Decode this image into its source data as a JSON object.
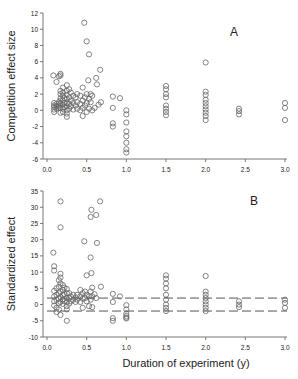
{
  "chart_data": [
    {
      "type": "scatter",
      "panel_label": "A",
      "title": "",
      "xlabel": "",
      "ylabel": "Competition effect size",
      "xlim": [
        0,
        3.0
      ],
      "ylim": [
        -6,
        12
      ],
      "xticks": [
        "0.0",
        "0.5",
        "1.0",
        "1.5",
        "2.0",
        "2.5",
        "3.0"
      ],
      "yticks": [
        "-6",
        "-4",
        "-2",
        "0",
        "2",
        "4",
        "6",
        "8",
        "10",
        "12"
      ],
      "grid": false,
      "legend": null,
      "marker": "open-circle",
      "points": [
        [
          0.08,
          4.3
        ],
        [
          0.12,
          3.5
        ],
        [
          0.15,
          4.2
        ],
        [
          0.17,
          4.5
        ],
        [
          0.17,
          4.3
        ],
        [
          0.09,
          0.9
        ],
        [
          0.09,
          0.6
        ],
        [
          0.09,
          0.4
        ],
        [
          0.09,
          0.1
        ],
        [
          0.09,
          -0.2
        ],
        [
          0.12,
          0.8
        ],
        [
          0.12,
          0.5
        ],
        [
          0.12,
          0.2
        ],
        [
          0.15,
          1.0
        ],
        [
          0.15,
          0.6
        ],
        [
          0.15,
          0.3
        ],
        [
          0.17,
          2.4
        ],
        [
          0.17,
          2.0
        ],
        [
          0.17,
          1.5
        ],
        [
          0.17,
          1.2
        ],
        [
          0.17,
          0.8
        ],
        [
          0.17,
          0.3
        ],
        [
          0.17,
          -0.3
        ],
        [
          0.2,
          2.8
        ],
        [
          0.2,
          2.2
        ],
        [
          0.2,
          1.8
        ],
        [
          0.2,
          1.2
        ],
        [
          0.2,
          0.7
        ],
        [
          0.2,
          0.2
        ],
        [
          0.2,
          -0.2
        ],
        [
          0.22,
          1.5
        ],
        [
          0.22,
          0.9
        ],
        [
          0.22,
          0.4
        ],
        [
          0.25,
          3.1
        ],
        [
          0.25,
          2.4
        ],
        [
          0.25,
          1.9
        ],
        [
          0.25,
          1.4
        ],
        [
          0.25,
          0.9
        ],
        [
          0.25,
          0.5
        ],
        [
          0.25,
          0.0
        ],
        [
          0.25,
          -0.4
        ],
        [
          0.25,
          -0.8
        ],
        [
          0.28,
          2.6
        ],
        [
          0.28,
          1.6
        ],
        [
          0.28,
          0.8
        ],
        [
          0.28,
          0.2
        ],
        [
          0.3,
          2.2
        ],
        [
          0.3,
          1.2
        ],
        [
          0.3,
          0.5
        ],
        [
          0.33,
          1.8
        ],
        [
          0.33,
          0.9
        ],
        [
          0.33,
          0.1
        ],
        [
          0.36,
          1.6
        ],
        [
          0.36,
          0.6
        ],
        [
          0.38,
          2.0
        ],
        [
          0.38,
          1.0
        ],
        [
          0.38,
          0.2
        ],
        [
          0.42,
          1.8
        ],
        [
          0.42,
          0.8
        ],
        [
          0.42,
          0.0
        ],
        [
          0.45,
          2.8
        ],
        [
          0.45,
          1.2
        ],
        [
          0.45,
          0.3
        ],
        [
          0.45,
          -0.7
        ],
        [
          0.48,
          1.6
        ],
        [
          0.48,
          0.6
        ],
        [
          0.5,
          2.0
        ],
        [
          0.5,
          0.9
        ],
        [
          0.5,
          -0.2
        ],
        [
          0.53,
          1.4
        ],
        [
          0.53,
          0.2
        ],
        [
          0.55,
          2.0
        ],
        [
          0.55,
          1.0
        ],
        [
          0.57,
          1.8
        ],
        [
          0.57,
          0.0
        ],
        [
          0.6,
          0.3
        ],
        [
          0.62,
          4.0
        ],
        [
          0.63,
          3.2
        ],
        [
          0.65,
          0.7
        ],
        [
          0.67,
          5.0
        ],
        [
          0.68,
          1.0
        ],
        [
          0.52,
          3.7
        ],
        [
          0.47,
          10.8
        ],
        [
          0.5,
          8.5
        ],
        [
          0.53,
          6.9
        ],
        [
          0.83,
          1.7
        ],
        [
          0.83,
          0.3
        ],
        [
          0.83,
          -1.6
        ],
        [
          0.83,
          -2.0
        ],
        [
          0.92,
          1.5
        ],
        [
          1.0,
          0.0
        ],
        [
          1.0,
          -0.5
        ],
        [
          1.0,
          -1.5
        ],
        [
          1.0,
          -2.6
        ],
        [
          1.0,
          -3.2
        ],
        [
          1.0,
          -4.0
        ],
        [
          1.0,
          -4.8
        ],
        [
          1.0,
          -5.2
        ],
        [
          1.5,
          3.0
        ],
        [
          1.5,
          2.6
        ],
        [
          1.5,
          2.0
        ],
        [
          1.5,
          1.6
        ],
        [
          1.5,
          0.6
        ],
        [
          1.5,
          0.2
        ],
        [
          1.5,
          -0.2
        ],
        [
          1.5,
          -0.6
        ],
        [
          2.0,
          5.9
        ],
        [
          2.0,
          2.3
        ],
        [
          2.0,
          1.9
        ],
        [
          2.0,
          1.3
        ],
        [
          2.0,
          0.9
        ],
        [
          2.0,
          0.5
        ],
        [
          2.0,
          0.1
        ],
        [
          2.0,
          -0.3
        ],
        [
          2.0,
          -0.7
        ],
        [
          2.0,
          -1.2
        ],
        [
          2.42,
          0.2
        ],
        [
          2.42,
          -0.1
        ],
        [
          2.42,
          -0.5
        ],
        [
          3.0,
          0.9
        ],
        [
          3.0,
          0.3
        ],
        [
          3.0,
          -1.2
        ]
      ]
    },
    {
      "type": "scatter",
      "panel_label": "B",
      "title": "",
      "xlabel": "Duration of experiment (y)",
      "ylabel": "Standardized effect",
      "xlim": [
        0,
        3.0
      ],
      "ylim": [
        -10,
        35
      ],
      "xticks": [
        "0.0",
        "0.5",
        "1.0",
        "1.5",
        "2.0",
        "2.5",
        "3.0"
      ],
      "yticks": [
        "-10",
        "-5",
        "0",
        "5",
        "10",
        "15",
        "20",
        "25",
        "30",
        "35"
      ],
      "grid": false,
      "legend": null,
      "marker": "open-circle",
      "reference_lines": [
        {
          "y": 2,
          "style": "dashed"
        },
        {
          "y": -2,
          "style": "dashed"
        }
      ],
      "points": [
        [
          0.08,
          16.0
        ],
        [
          0.09,
          11.8
        ],
        [
          0.09,
          10.5
        ],
        [
          0.17,
          31.8
        ],
        [
          0.17,
          23.8
        ],
        [
          0.17,
          9.5
        ],
        [
          0.17,
          8.3
        ],
        [
          0.09,
          4.2
        ],
        [
          0.09,
          2.5
        ],
        [
          0.09,
          1.0
        ],
        [
          0.09,
          -0.3
        ],
        [
          0.12,
          5.0
        ],
        [
          0.12,
          3.0
        ],
        [
          0.12,
          1.5
        ],
        [
          0.12,
          -1.0
        ],
        [
          0.12,
          -2.3
        ],
        [
          0.15,
          7.5
        ],
        [
          0.15,
          5.5
        ],
        [
          0.15,
          3.5
        ],
        [
          0.15,
          1.8
        ],
        [
          0.15,
          0.5
        ],
        [
          0.15,
          -1.5
        ],
        [
          0.17,
          6.5
        ],
        [
          0.17,
          4.0
        ],
        [
          0.17,
          2.3
        ],
        [
          0.17,
          0.8
        ],
        [
          0.17,
          -3.2
        ],
        [
          0.2,
          6.0
        ],
        [
          0.2,
          4.5
        ],
        [
          0.2,
          3.0
        ],
        [
          0.2,
          1.5
        ],
        [
          0.2,
          0.2
        ],
        [
          0.22,
          5.2
        ],
        [
          0.22,
          3.2
        ],
        [
          0.22,
          1.0
        ],
        [
          0.25,
          4.8
        ],
        [
          0.25,
          3.5
        ],
        [
          0.25,
          2.0
        ],
        [
          0.25,
          0.8
        ],
        [
          0.25,
          -0.5
        ],
        [
          0.25,
          -1.5
        ],
        [
          0.25,
          -5.0
        ],
        [
          0.28,
          3.5
        ],
        [
          0.28,
          2.0
        ],
        [
          0.28,
          0.3
        ],
        [
          0.3,
          2.5
        ],
        [
          0.3,
          1.0
        ],
        [
          0.33,
          3.0
        ],
        [
          0.33,
          1.5
        ],
        [
          0.36,
          2.2
        ],
        [
          0.36,
          0.8
        ],
        [
          0.38,
          3.0
        ],
        [
          0.38,
          1.5
        ],
        [
          0.42,
          4.5
        ],
        [
          0.42,
          2.5
        ],
        [
          0.42,
          0.8
        ],
        [
          0.45,
          3.5
        ],
        [
          0.45,
          1.8
        ],
        [
          0.45,
          -1.0
        ],
        [
          0.48,
          4.0
        ],
        [
          0.48,
          2.0
        ],
        [
          0.5,
          3.0
        ],
        [
          0.5,
          1.0
        ],
        [
          0.53,
          2.5
        ],
        [
          0.53,
          -0.5
        ],
        [
          0.55,
          4.0
        ],
        [
          0.55,
          1.5
        ],
        [
          0.57,
          5.2
        ],
        [
          0.57,
          2.5
        ],
        [
          0.57,
          -0.8
        ],
        [
          0.6,
          3.2
        ],
        [
          0.62,
          2.0
        ],
        [
          0.68,
          5.5
        ],
        [
          0.47,
          19.5
        ],
        [
          0.5,
          9.0
        ],
        [
          0.55,
          14.5
        ],
        [
          0.55,
          27.0
        ],
        [
          0.56,
          29.2
        ],
        [
          0.56,
          9.7
        ],
        [
          0.62,
          27.6
        ],
        [
          0.63,
          19.0
        ],
        [
          0.67,
          31.8
        ],
        [
          0.83,
          3.3
        ],
        [
          0.83,
          0.8
        ],
        [
          0.83,
          -4.2
        ],
        [
          0.83,
          -5.0
        ],
        [
          0.92,
          2.5
        ],
        [
          1.0,
          -0.2
        ],
        [
          1.0,
          -1.5
        ],
        [
          1.0,
          -2.8
        ],
        [
          1.0,
          -3.5
        ],
        [
          1.0,
          -4.0
        ],
        [
          1.0,
          -4.3
        ],
        [
          1.5,
          9.0
        ],
        [
          1.5,
          8.0
        ],
        [
          1.5,
          6.5
        ],
        [
          1.5,
          5.0
        ],
        [
          1.5,
          3.0
        ],
        [
          1.5,
          1.5
        ],
        [
          1.5,
          0.0
        ],
        [
          1.5,
          -1.0
        ],
        [
          1.5,
          -2.0
        ],
        [
          2.0,
          8.8
        ],
        [
          2.0,
          4.0
        ],
        [
          2.0,
          3.0
        ],
        [
          2.0,
          2.0
        ],
        [
          2.0,
          1.0
        ],
        [
          2.0,
          0.0
        ],
        [
          2.0,
          -1.0
        ],
        [
          2.0,
          -2.0
        ],
        [
          2.42,
          1.0
        ],
        [
          2.42,
          0.0
        ],
        [
          2.42,
          -0.8
        ],
        [
          3.0,
          1.5
        ],
        [
          3.0,
          0.5
        ],
        [
          3.0,
          -1.0
        ]
      ]
    }
  ],
  "figure": {
    "panel_a_label": "A",
    "panel_b_label": "B",
    "panel_a_ylabel": "Competition effect size",
    "panel_b_ylabel": "Standardized effect",
    "xlabel": "Duration of experiment (y)"
  }
}
